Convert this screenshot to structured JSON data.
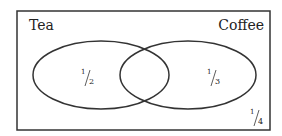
{
  "diagram": {
    "type": "venn",
    "sets": [
      {
        "name": "Tea",
        "fraction_label_num": "1",
        "fraction_label_den": "2"
      },
      {
        "name": "Coffee",
        "fraction_label_num": "1",
        "fraction_label_den": "3"
      }
    ],
    "outside": {
      "fraction_label_num": "1",
      "fraction_label_den": "4"
    },
    "stroke_color": "#333333"
  }
}
